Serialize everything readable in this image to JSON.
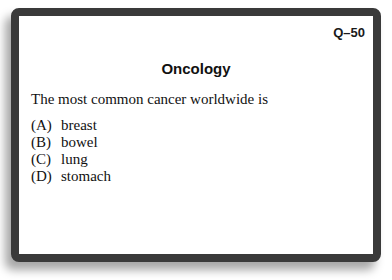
{
  "card": {
    "question_number": "Q–50",
    "title": "Oncology",
    "question": "The most common cancer worldwide is",
    "options": [
      {
        "letter": "(A)",
        "text": "breast"
      },
      {
        "letter": "(B)",
        "text": "bowel"
      },
      {
        "letter": "(C)",
        "text": "lung"
      },
      {
        "letter": "(D)",
        "text": "stomach"
      }
    ]
  }
}
